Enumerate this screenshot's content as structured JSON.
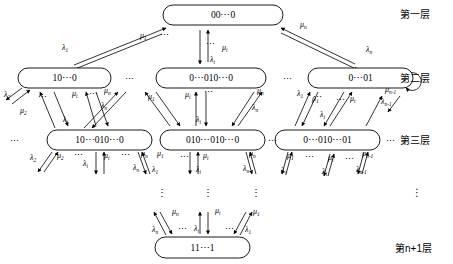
{
  "diagram": {
    "layer_labels": [
      {
        "id": "layer-1",
        "text": "第一层",
        "x": 400,
        "y": 18
      },
      {
        "id": "layer-2",
        "text": "第二层",
        "x": 400,
        "y": 82
      },
      {
        "id": "layer-3",
        "text": "第三层",
        "x": 400,
        "y": 144
      },
      {
        "id": "layer-dots",
        "text": "⋮",
        "x": 412,
        "y": 196
      },
      {
        "id": "layer-n1",
        "text": "第n+1层",
        "x": 395,
        "y": 252
      }
    ],
    "nodes": [
      {
        "id": "n-00-0",
        "label": "00⋯0",
        "x": 163,
        "y": 5,
        "w": 120,
        "h": 20
      },
      {
        "id": "n-10-0",
        "label": "10⋯0",
        "x": 18,
        "y": 68,
        "w": 93,
        "h": 20
      },
      {
        "id": "n-0-010-0",
        "label": "0⋯010⋯0",
        "x": 156,
        "y": 68,
        "w": 110,
        "h": 20
      },
      {
        "id": "n-0-01",
        "label": "0⋯01",
        "x": 308,
        "y": 68,
        "w": 105,
        "h": 20
      },
      {
        "id": "n-10-010-0",
        "label": "10⋯010⋯0",
        "x": 47,
        "y": 130,
        "w": 105,
        "h": 20
      },
      {
        "id": "n-010-010-0",
        "label": "010⋯010⋯0",
        "x": 160,
        "y": 130,
        "w": 105,
        "h": 20
      },
      {
        "id": "n-0-010-01",
        "label": "0⋯010⋯01",
        "x": 275,
        "y": 130,
        "w": 105,
        "h": 20
      },
      {
        "id": "n-11-1",
        "label": "11⋯1",
        "x": 155,
        "y": 237,
        "w": 95,
        "h": 21
      }
    ],
    "edge_labels": [
      {
        "id": "e1",
        "sym": "λ",
        "sub": "1",
        "x": 62,
        "y": 50
      },
      {
        "id": "e2",
        "sym": "μ",
        "sub": "1",
        "x": 140,
        "y": 38
      },
      {
        "id": "e3",
        "sym": "μ",
        "sub": "i",
        "x": 222,
        "y": 50
      },
      {
        "id": "e4",
        "sym": "λ",
        "sub": "i",
        "x": 210,
        "y": 62
      },
      {
        "id": "e5",
        "sym": "μ",
        "sub": "n",
        "x": 300,
        "y": 27
      },
      {
        "id": "e6",
        "sym": "λ",
        "sub": "n",
        "x": 366,
        "y": 52
      },
      {
        "id": "e7",
        "sym": "λ",
        "sub": "2",
        "x": 4,
        "y": 97
      },
      {
        "id": "e8",
        "sym": "μ",
        "sub": "2",
        "x": 20,
        "y": 113
      },
      {
        "id": "e9",
        "sym": "μ",
        "sub": "i",
        "x": 72,
        "y": 96
      },
      {
        "id": "e10",
        "sym": "μ",
        "sub": "n",
        "x": 104,
        "y": 93
      },
      {
        "id": "e11",
        "sym": "λ",
        "sub": "n",
        "x": 101,
        "y": 108
      },
      {
        "id": "e12",
        "sym": "λ",
        "sub": "i",
        "x": 63,
        "y": 122
      },
      {
        "id": "e13",
        "sym": "μ",
        "sub": "1",
        "x": 148,
        "y": 99
      },
      {
        "id": "e14",
        "sym": "μ",
        "sub": "i",
        "x": 185,
        "y": 97
      },
      {
        "id": "e15",
        "sym": "μ",
        "sub": "n",
        "x": 257,
        "y": 93
      },
      {
        "id": "e16",
        "sym": "λ",
        "sub": "n",
        "x": 252,
        "y": 110
      },
      {
        "id": "e17",
        "sym": "λ",
        "sub": "i",
        "x": 196,
        "y": 122
      },
      {
        "id": "e18",
        "sym": "λ",
        "sub": "1",
        "x": 297,
        "y": 96
      },
      {
        "id": "e19",
        "sym": "μ",
        "sub": "1",
        "x": 312,
        "y": 101
      },
      {
        "id": "e20",
        "sym": "μ",
        "sub": "i",
        "x": 350,
        "y": 101
      },
      {
        "id": "e21",
        "sym": "λ",
        "sub": "i",
        "x": 320,
        "y": 117
      },
      {
        "id": "e22",
        "sym": "λ",
        "sub": "n-1",
        "x": 381,
        "y": 104
      },
      {
        "id": "e23",
        "sym": "μ",
        "sub": "n-1",
        "x": 385,
        "y": 92
      },
      {
        "id": "e24",
        "sym": "λ",
        "sub": "2",
        "x": 30,
        "y": 160
      },
      {
        "id": "e25",
        "sym": "μ",
        "sub": "2",
        "x": 57,
        "y": 158
      },
      {
        "id": "e26",
        "sym": "λ",
        "sub": "i",
        "x": 83,
        "y": 166
      },
      {
        "id": "e27",
        "sym": "μ",
        "sub": "i",
        "x": 104,
        "y": 158
      },
      {
        "id": "e28",
        "sym": "μ",
        "sub": "n",
        "x": 141,
        "y": 156
      },
      {
        "id": "e29",
        "sym": "λ",
        "sub": "n",
        "x": 133,
        "y": 170
      },
      {
        "id": "e30",
        "sym": "μ",
        "sub": "1",
        "x": 157,
        "y": 156
      },
      {
        "id": "e31",
        "sym": "λ",
        "sub": "1",
        "x": 152,
        "y": 172
      },
      {
        "id": "e32",
        "sym": "μ",
        "sub": "i",
        "x": 203,
        "y": 158
      },
      {
        "id": "e33",
        "sym": "λ",
        "sub": "i",
        "x": 196,
        "y": 172
      },
      {
        "id": "e34",
        "sym": "μ",
        "sub": "n",
        "x": 249,
        "y": 156
      },
      {
        "id": "e35",
        "sym": "λ",
        "sub": "n",
        "x": 243,
        "y": 171
      },
      {
        "id": "e36",
        "sym": "μ",
        "sub": "1",
        "x": 287,
        "y": 158
      },
      {
        "id": "e37",
        "sym": "λ",
        "sub": "1",
        "x": 281,
        "y": 173
      },
      {
        "id": "e38",
        "sym": "μ",
        "sub": "i",
        "x": 328,
        "y": 160
      },
      {
        "id": "e39",
        "sym": "λ",
        "sub": "i",
        "x": 322,
        "y": 174
      },
      {
        "id": "e40",
        "sym": "μ",
        "sub": "n-1",
        "x": 362,
        "y": 156
      },
      {
        "id": "e41",
        "sym": "λ",
        "sub": "n-1",
        "x": 356,
        "y": 172
      },
      {
        "id": "e42",
        "sym": "μ",
        "sub": "n",
        "x": 172,
        "y": 214
      },
      {
        "id": "e43",
        "sym": "λ",
        "sub": "n",
        "x": 152,
        "y": 232
      },
      {
        "id": "e44",
        "sym": "μ",
        "sub": "i",
        "x": 215,
        "y": 213
      },
      {
        "id": "e45",
        "sym": "λ",
        "sub": "i",
        "x": 194,
        "y": 231
      },
      {
        "id": "e46",
        "sym": "μ",
        "sub": "1",
        "x": 253,
        "y": 214
      },
      {
        "id": "e47",
        "sym": "λ",
        "sub": "1",
        "x": 245,
        "y": 232
      }
    ],
    "h_ellipses": [
      {
        "id": "h1",
        "text": "⋯",
        "x": 125,
        "y": 82
      },
      {
        "id": "h2",
        "text": "⋯",
        "x": 283,
        "y": 82
      },
      {
        "id": "h3",
        "text": "⋯",
        "x": 10,
        "y": 144
      },
      {
        "id": "h4",
        "text": "⋯",
        "x": 268,
        "y": 144
      },
      {
        "id": "h5",
        "text": "⋯",
        "x": 386,
        "y": 144
      },
      {
        "id": "h6",
        "text": "⋯",
        "x": 38,
        "y": 100
      },
      {
        "id": "h7",
        "text": "⋯",
        "x": 160,
        "y": 38
      },
      {
        "id": "h8",
        "text": "⋯",
        "x": 206,
        "y": 47
      },
      {
        "id": "h9",
        "text": "⋯",
        "x": 89,
        "y": 97
      },
      {
        "id": "h10",
        "text": "⋯",
        "x": 204,
        "y": 95
      },
      {
        "id": "h11",
        "text": "⋯",
        "x": 313,
        "y": 100
      },
      {
        "id": "h12",
        "text": "⋯",
        "x": 336,
        "y": 103
      },
      {
        "id": "h13",
        "text": "⋯",
        "x": 74,
        "y": 158
      },
      {
        "id": "h14",
        "text": "⋯",
        "x": 121,
        "y": 158
      },
      {
        "id": "h15",
        "text": "⋯",
        "x": 180,
        "y": 160
      },
      {
        "id": "h16",
        "text": "⋯",
        "x": 305,
        "y": 160
      },
      {
        "id": "h17",
        "text": "⋯",
        "x": 345,
        "y": 162
      },
      {
        "id": "h18",
        "text": "⋯",
        "x": 178,
        "y": 232
      },
      {
        "id": "h19",
        "text": "⋯",
        "x": 225,
        "y": 232
      }
    ],
    "v_ellipses": [
      {
        "id": "v1",
        "text": "⋮",
        "x": 157,
        "y": 196
      },
      {
        "id": "v2",
        "text": "⋮",
        "x": 203,
        "y": 196
      },
      {
        "id": "v3",
        "text": "⋮",
        "x": 251,
        "y": 196
      }
    ]
  }
}
